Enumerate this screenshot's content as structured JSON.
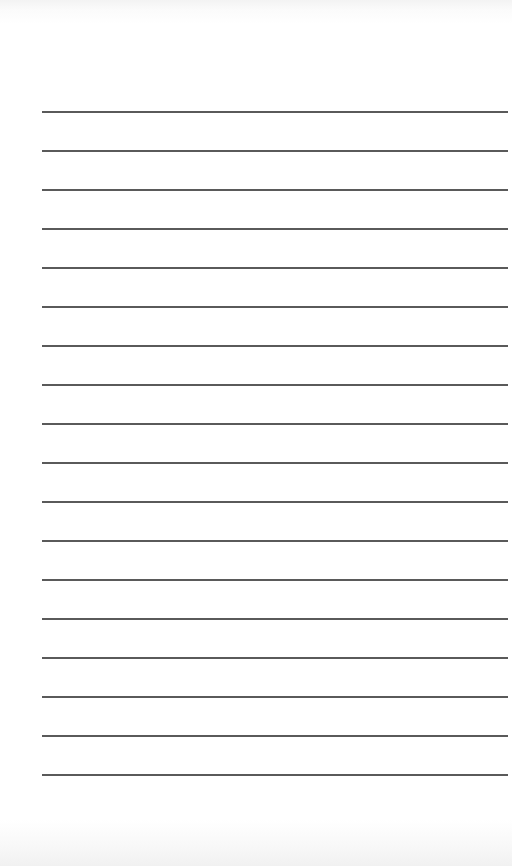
{
  "page": {
    "type": "lined-paper",
    "background_color": "#ffffff",
    "rule_color": "#5a5a5a",
    "rule_count": 18,
    "rule_left_px": 42,
    "rule_right_px": 508,
    "first_rule_y_px": 111,
    "rule_spacing_px": 39,
    "text": ""
  }
}
